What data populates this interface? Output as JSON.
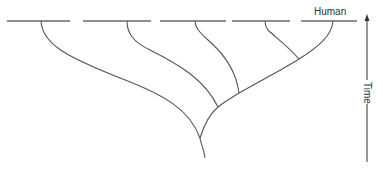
{
  "diagram": {
    "type": "phylogenetic-tree",
    "tip_labels": [
      "",
      "",
      "",
      "",
      "Human"
    ],
    "axis": {
      "label": "Time",
      "direction": "up"
    },
    "colors": {
      "line": "#555555",
      "text": "#333333"
    }
  }
}
